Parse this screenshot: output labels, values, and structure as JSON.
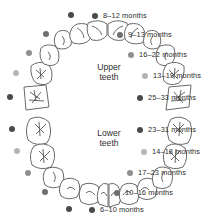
{
  "figure": {
    "arch_labels": {
      "upper": "Upper\nteeth",
      "upper_line1": "Upper",
      "upper_line2": "teeth",
      "lower_line1": "Lower",
      "lower_line2": "teeth"
    }
  },
  "colors": {
    "dark": "#4a4a4a",
    "mid": "#6e6e6e",
    "gray": "#8f8f8f",
    "light": "#b5b5b5",
    "outline": "#6a6a6a",
    "text": "#2b2b2b",
    "background": "#ffffff"
  },
  "chart_data": {
    "type": "diagram-legend",
    "xlabel": "",
    "ylabel": "",
    "legend_position": "right",
    "categories": [
      "8–12 months",
      "9–13 months",
      "16–22 months",
      "13–19 months",
      "25–33 months",
      "23–31 months",
      "14–18 months",
      "17–23 months",
      "10–16 months",
      "6–10 months"
    ],
    "series": [
      {
        "name": "Upper teeth",
        "entries": [
          {
            "label": "8–12 months",
            "tooth": "central incisor",
            "color": "#4a4a4a",
            "low": 8,
            "high": 12
          },
          {
            "label": "9–13 months",
            "tooth": "lateral incisor",
            "color": "#6e6e6e",
            "low": 9,
            "high": 13
          },
          {
            "label": "16–22 months",
            "tooth": "canine",
            "color": "#8f8f8f",
            "low": 16,
            "high": 22
          },
          {
            "label": "13–19 months",
            "tooth": "first molar",
            "color": "#b5b5b5",
            "low": 13,
            "high": 19
          },
          {
            "label": "25–33 months",
            "tooth": "second molar",
            "color": "#4a4a4a",
            "low": 25,
            "high": 33
          }
        ]
      },
      {
        "name": "Lower teeth",
        "entries": [
          {
            "label": "23–31 months",
            "tooth": "second molar",
            "color": "#4a4a4a",
            "low": 23,
            "high": 31
          },
          {
            "label": "14–18 months",
            "tooth": "first molar",
            "color": "#b5b5b5",
            "low": 14,
            "high": 18
          },
          {
            "label": "17–23 months",
            "tooth": "canine",
            "color": "#8f8f8f",
            "low": 17,
            "high": 23
          },
          {
            "label": "10–16 months",
            "tooth": "lateral incisor",
            "color": "#6e6e6e",
            "low": 10,
            "high": 16
          },
          {
            "label": "6–10 months",
            "tooth": "central incisor",
            "color": "#4a4a4a",
            "low": 6,
            "high": 10
          }
        ]
      }
    ]
  },
  "legend": [
    {
      "label": "8–12 months",
      "color": "#4a4a4a",
      "x": 92,
      "y": 12,
      "name": "legend-item-8-12-months"
    },
    {
      "label": "9–13 months",
      "color": "#6e6e6e",
      "x": 117,
      "y": 31,
      "name": "legend-item-9-13-months"
    },
    {
      "label": "16–22 months",
      "color": "#8f8f8f",
      "x": 128,
      "y": 51,
      "name": "legend-item-16-22-months"
    },
    {
      "label": "13–19 months",
      "color": "#b5b5b5",
      "x": 142,
      "y": 72,
      "name": "legend-item-13-19-months"
    },
    {
      "label": "25–33 months",
      "color": "#4a4a4a",
      "x": 137,
      "y": 94,
      "name": "legend-item-25-33-months"
    },
    {
      "label": "23–31 months",
      "color": "#4a4a4a",
      "x": 137,
      "y": 126,
      "name": "legend-item-23-31-months"
    },
    {
      "label": "14–18 months",
      "color": "#b5b5b5",
      "x": 141,
      "y": 148,
      "name": "legend-item-14-18-months"
    },
    {
      "label": "17–23 months",
      "color": "#8f8f8f",
      "x": 127,
      "y": 169,
      "name": "legend-item-17-23-months"
    },
    {
      "label": "10–16 months",
      "color": "#6e6e6e",
      "x": 114,
      "y": 189,
      "name": "legend-item-10-16-months"
    },
    {
      "label": "6–10 months",
      "color": "#4a4a4a",
      "x": 89,
      "y": 206,
      "name": "legend-item-6-10-months"
    }
  ],
  "arch_markers": [
    {
      "name": "arch-dot-upper-central-incisor-left",
      "color": "#4a4a4a",
      "x": 68,
      "y": 12
    },
    {
      "name": "arch-dot-upper-lateral-incisor-left",
      "color": "#6e6e6e",
      "x": 43,
      "y": 31
    },
    {
      "name": "arch-dot-upper-canine-left",
      "color": "#8f8f8f",
      "x": 26,
      "y": 50
    },
    {
      "name": "arch-dot-upper-first-molar-left",
      "color": "#b5b5b5",
      "x": 13,
      "y": 70
    },
    {
      "name": "arch-dot-upper-second-molar-left",
      "color": "#4a4a4a",
      "x": 7,
      "y": 94
    },
    {
      "name": "arch-dot-lower-second-molar-left",
      "color": "#4a4a4a",
      "x": 9,
      "y": 126
    },
    {
      "name": "arch-dot-lower-first-molar-left",
      "color": "#b5b5b5",
      "x": 14,
      "y": 148
    },
    {
      "name": "arch-dot-lower-canine-left",
      "color": "#8f8f8f",
      "x": 25,
      "y": 170
    },
    {
      "name": "arch-dot-lower-lateral-incisor-left",
      "color": "#6e6e6e",
      "x": 42,
      "y": 189
    },
    {
      "name": "arch-dot-lower-central-incisor-left",
      "color": "#4a4a4a",
      "x": 66,
      "y": 206
    }
  ]
}
